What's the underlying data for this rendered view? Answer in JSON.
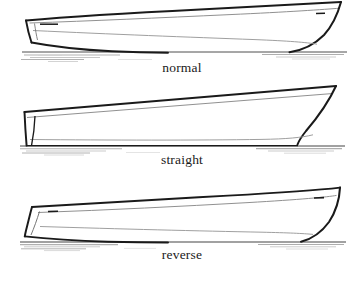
{
  "figure": {
    "kind": "technical-line-drawing",
    "background_color": "#ffffff",
    "ink_color": "#1a1a1a",
    "secondary_line_color": "#8e8e8e",
    "water_line_color": "#3a3a3a",
    "wake_color": "#b0b0b0"
  },
  "panels": [
    {
      "id": "normal",
      "label": "normal",
      "bow_profile": "convex flared raked stem",
      "stern_profile": "angled transom with chine",
      "label_top_px": 60
    },
    {
      "id": "straight",
      "label": "straight",
      "bow_profile": "straight angled raked stem",
      "stern_profile": "near vertical transom",
      "label_top_px": 152
    },
    {
      "id": "reverse",
      "label": "reverse",
      "bow_profile": "concave hollow reverse stem",
      "stern_profile": "curved transom sloping down aft",
      "label_top_px": 247
    }
  ],
  "chart_data": {
    "type": "line",
    "title": "",
    "xlabel": "",
    "ylabel": "",
    "legend": [
      "normal",
      "straight",
      "reverse"
    ],
    "panels": [
      {
        "name": "normal",
        "waterline_y": 52,
        "sheer": [
          [
            26,
            20
          ],
          [
            60,
            17.5
          ],
          [
            120,
            14
          ],
          [
            190,
            10
          ],
          [
            250,
            7
          ],
          [
            300,
            4
          ],
          [
            330,
            2.5
          ],
          [
            341,
            2
          ]
        ],
        "gunwale": [
          [
            30,
            23
          ],
          [
            90,
            21
          ],
          [
            160,
            18
          ],
          [
            230,
            15
          ],
          [
            290,
            12
          ],
          [
            330,
            9.5
          ],
          [
            339,
            8.5
          ]
        ],
        "stem": [
          [
            341,
            2
          ],
          [
            336,
            14
          ],
          [
            328,
            26
          ],
          [
            316,
            38
          ],
          [
            300,
            47
          ],
          [
            288,
            51
          ]
        ],
        "chine": [
          [
            34,
            30
          ],
          [
            110,
            34
          ],
          [
            190,
            37
          ],
          [
            260,
            39
          ],
          [
            300,
            41
          ],
          [
            316,
            43
          ]
        ],
        "transom": [
          [
            26,
            20
          ],
          [
            28,
            34
          ],
          [
            31,
            42
          ]
        ],
        "stern_keel": [
          [
            31,
            42
          ],
          [
            48,
            46
          ],
          [
            70,
            50
          ],
          [
            100,
            52
          ],
          [
            140,
            53
          ]
        ],
        "cleats": [
          [
            44,
            24
          ],
          [
            322,
            14
          ]
        ]
      },
      {
        "name": "straight",
        "waterline_y": 146,
        "sheer": [
          [
            25,
            112
          ],
          [
            90,
            107
          ],
          [
            170,
            100
          ],
          [
            240,
            94
          ],
          [
            300,
            89
          ],
          [
            336,
            86
          ]
        ],
        "gunwale": [
          [
            27,
            117
          ],
          [
            100,
            113
          ],
          [
            180,
            107
          ],
          [
            250,
            102
          ],
          [
            305,
            97
          ],
          [
            333,
            93
          ]
        ],
        "stem": [
          [
            336,
            86
          ],
          [
            327,
            103
          ],
          [
            316,
            120
          ],
          [
            305,
            134
          ],
          [
            298,
            143
          ]
        ],
        "chine": [
          [
            30,
            139
          ],
          [
            110,
            140
          ],
          [
            200,
            140
          ],
          [
            270,
            139
          ],
          [
            300,
            137
          ],
          [
            312,
            134
          ]
        ],
        "transom": [
          [
            25,
            112
          ],
          [
            26,
            128
          ],
          [
            28,
            145
          ]
        ],
        "transom_inner": [
          [
            35,
            116
          ],
          [
            34,
            130
          ],
          [
            31,
            144
          ]
        ],
        "cleats": []
      },
      {
        "name": "reverse",
        "waterline_y": 242,
        "sheer": [
          [
            32,
            207
          ],
          [
            90,
            203
          ],
          [
            160,
            199
          ],
          [
            230,
            195
          ],
          [
            290,
            191
          ],
          [
            330,
            188
          ],
          [
            340,
            187
          ]
        ],
        "gunwale": [
          [
            38,
            212
          ],
          [
            110,
            210
          ],
          [
            180,
            206
          ],
          [
            250,
            202
          ],
          [
            305,
            198
          ],
          [
            336,
            195
          ]
        ],
        "stem": [
          [
            340,
            187
          ],
          [
            338,
            199
          ],
          [
            333,
            211
          ],
          [
            323,
            224
          ],
          [
            310,
            234
          ],
          [
            300,
            240
          ]
        ],
        "chine": [
          [
            40,
            226
          ],
          [
            120,
            229
          ],
          [
            200,
            231
          ],
          [
            265,
            232
          ],
          [
            300,
            233
          ],
          [
            312,
            234
          ]
        ],
        "transom": [
          [
            32,
            207
          ],
          [
            29,
            218
          ],
          [
            26,
            230
          ],
          [
            25,
            236
          ]
        ],
        "transom_inner": [
          [
            40,
            211
          ],
          [
            36,
            222
          ],
          [
            32,
            233
          ]
        ],
        "stern_keel": [
          [
            25,
            236
          ],
          [
            45,
            239
          ],
          [
            70,
            241
          ],
          [
            100,
            242
          ],
          [
            130,
            242
          ]
        ],
        "cleats": [
          [
            52,
            211
          ],
          [
            320,
            198
          ]
        ]
      }
    ]
  }
}
